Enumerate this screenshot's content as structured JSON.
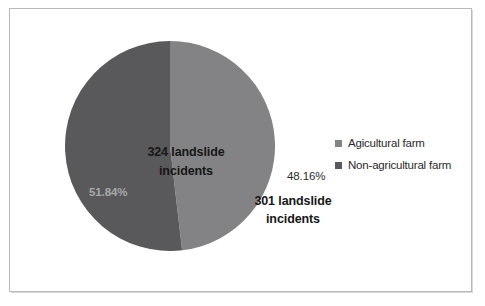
{
  "figure": {
    "background_color": "#ffffff",
    "frame_color": "#b9b9bb"
  },
  "chart_data": {
    "type": "pie",
    "title": "",
    "subtitle": "",
    "xlabel": "",
    "ylabel": "",
    "grid": false,
    "legend_position": "right",
    "start_angle_deg": 0,
    "direction": "clockwise",
    "total": 625,
    "categories": [
      "Agicultural farm",
      "Non-agricultural farm"
    ],
    "values": [
      301,
      324
    ],
    "percentages": [
      48.16,
      51.84
    ],
    "slices": [
      {
        "name": "Agicultural farm",
        "value": 301,
        "percent": 48.16,
        "percent_label": "48.16%",
        "count_label": "301 landslide",
        "count_label_line2": "incidents",
        "color": "#838385",
        "label_text_color": "#2b2b2b"
      },
      {
        "name": "Non-agricultural farm",
        "value": 324,
        "percent": 51.84,
        "percent_label": "51.84%",
        "count_label": "324 landslide",
        "count_label_line2": "incidents",
        "color": "#59595b",
        "label_text_color": "#a8a8aa"
      }
    ]
  },
  "legend": {
    "items": [
      {
        "label": "Agicultural farm",
        "color": "#838385"
      },
      {
        "label": "Non-agricultural farm",
        "color": "#59595b"
      }
    ]
  }
}
